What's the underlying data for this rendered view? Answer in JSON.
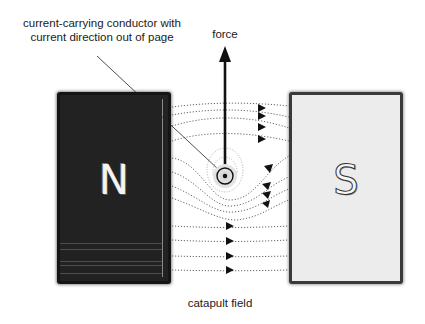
{
  "labels": {
    "conductor_line1": "current-carrying conductor with",
    "conductor_line2": "current direction out of page",
    "force": "force",
    "catapult": "catapult field"
  },
  "magnets": {
    "north": {
      "letter": "N",
      "color": "#222222"
    },
    "south": {
      "letter": "S",
      "color": "#ececec"
    }
  },
  "conductor": {
    "symbol": "dot",
    "meaning": "current out of page"
  },
  "colors": {
    "field_lines": "#555555",
    "arrow": "#111111",
    "background": "#ffffff"
  }
}
